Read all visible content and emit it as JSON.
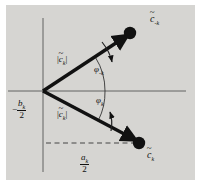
{
  "figure": {
    "background_color": "#ffffff",
    "plot_background_color": "#d6d5d2",
    "ink_color": "#111111",
    "width": 201,
    "height": 185
  },
  "axes": {
    "origin": {
      "x": 43,
      "y": 91
    },
    "horizontal_axis": {
      "name": "real-axis",
      "x1": 8,
      "y1": 91,
      "x2": 186,
      "y2": 91
    },
    "vertical_axis": {
      "name": "imaginary-axis",
      "x1": 43,
      "y1": 18,
      "x2": 43,
      "y2": 172
    },
    "dashed_guide": {
      "name": "a-over-2-guide",
      "x1": 46,
      "y1": 143,
      "x2": 140,
      "y2": 143
    }
  },
  "labels": {
    "vector_upper_head": {
      "symbol": "c",
      "tilde": "~",
      "subscript": "-k",
      "text": "c̃₋ₖ"
    },
    "vector_lower_head": {
      "symbol": "c",
      "tilde": "~",
      "subscript": "k",
      "text": "c̃ₖ"
    },
    "magnitude_upper": {
      "open": "|",
      "symbol": "c",
      "tilde": "~",
      "subscript": "k",
      "close": "|",
      "text": "|c̃ₖ|"
    },
    "magnitude_lower": {
      "open": "|",
      "symbol": "c",
      "tilde": "~",
      "subscript": "k",
      "close": "|",
      "text": "|c̃ₖ|"
    },
    "angle_upper": {
      "symbol": "φ",
      "subscript": "-k",
      "text": "φ₋ₖ"
    },
    "angle_lower": {
      "symbol": "φ",
      "subscript": "k",
      "text": "φₖ"
    },
    "axis_left": {
      "sign": "−",
      "numerator_symbol": "b",
      "numerator_subscript": "k",
      "denominator": "2",
      "text": "-b_k/2"
    },
    "axis_bottom": {
      "numerator_symbol": "a",
      "numerator_subscript": "k",
      "denominator": "2",
      "text": "a_k/2"
    }
  },
  "vectors": [
    {
      "name": "vector-c-minus-k",
      "from": {
        "x": 43,
        "y": 91
      },
      "to": {
        "x": 126,
        "y": 36
      },
      "head_dot": {
        "x": 129,
        "y": 33,
        "r": 6
      }
    },
    {
      "name": "vector-c-k",
      "from": {
        "x": 43,
        "y": 91
      },
      "to": {
        "x": 134,
        "y": 140
      },
      "head_dot": {
        "x": 138,
        "y": 143,
        "r": 6
      }
    }
  ],
  "arcs": [
    {
      "name": "angle-arc-upper",
      "radius": 62,
      "start_deg": 0,
      "end_deg": 33
    },
    {
      "name": "angle-arc-lower",
      "radius": 62,
      "start_deg": 0,
      "end_deg": -28
    }
  ],
  "rotation_arrows": [
    {
      "name": "rotation-arrow-upper",
      "direction": "clockwise-down-right"
    },
    {
      "name": "rotation-arrow-lower",
      "direction": "counterclockwise-up-left"
    }
  ]
}
